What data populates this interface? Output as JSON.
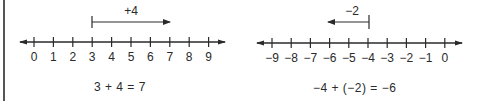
{
  "diagrams": [
    {
      "id": "addition-positive",
      "number_line": {
        "min": 0,
        "max": 9,
        "tick_labels": [
          "0",
          "1",
          "2",
          "3",
          "4",
          "5",
          "6",
          "7",
          "8",
          "9"
        ]
      },
      "move": {
        "start": 3,
        "end": 7,
        "label": "+4",
        "direction": "right"
      },
      "equation": "3 + 4 = 7"
    },
    {
      "id": "addition-negative",
      "number_line": {
        "min": -9,
        "max": 0,
        "tick_labels": [
          "−9",
          "−8",
          "−7",
          "−6",
          "−5",
          "−4",
          "−3",
          "−2",
          "−1",
          "0"
        ]
      },
      "move": {
        "start": -4,
        "end": -6,
        "label": "−2",
        "direction": "left"
      },
      "equation": "−4 + (−2) = −6"
    }
  ],
  "colors": {
    "ink": "#2a2a2a",
    "border": "#555555",
    "background": "#ffffff"
  }
}
